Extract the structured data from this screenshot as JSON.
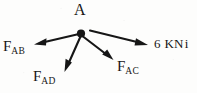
{
  "figure": {
    "type": "free-body-force-diagram",
    "background_color": "#fdfdfc",
    "ink_color": "#161616",
    "point_label": "A",
    "magnitude_label": {
      "value": "6",
      "unit": "KN",
      "direction_symbol": "i",
      "full_text": "6 KN i"
    },
    "forces": [
      {
        "name": "force-ab",
        "symbol": "F",
        "subscript": "AB",
        "label": "F",
        "direction": "left-down"
      },
      {
        "name": "force-ad",
        "symbol": "F",
        "subscript": "AD",
        "label": "F",
        "direction": "down-left"
      },
      {
        "name": "force-ac",
        "symbol": "F",
        "subscript": "AC",
        "label": "F",
        "direction": "down-right"
      },
      {
        "name": "force-applied",
        "symbol": "6 KN",
        "subscript": "",
        "label": "6 KN i",
        "direction": "right-down"
      }
    ]
  }
}
